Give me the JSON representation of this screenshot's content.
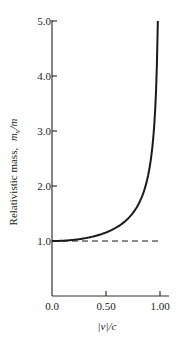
{
  "chart_data": {
    "type": "line",
    "title": "",
    "xlabel": "|v|/c",
    "ylabel_text": "Relativistic  mass,",
    "ylabel_symbol": "m_v/m",
    "xlim": [
      0.0,
      1.0
    ],
    "ylim": [
      0.0,
      5.0
    ],
    "xticks": [
      {
        "value": 0.0,
        "label": "0.0"
      },
      {
        "value": 0.5,
        "label": "0.50"
      },
      {
        "value": 1.0,
        "label": "1.00"
      }
    ],
    "yticks": [
      {
        "value": 1.0,
        "label": "1.0"
      },
      {
        "value": 2.0,
        "label": "2.0"
      },
      {
        "value": 3.0,
        "label": "3.0"
      },
      {
        "value": 4.0,
        "label": "4.0"
      },
      {
        "value": 5.0,
        "label": "5.0"
      }
    ],
    "grid": false,
    "legend": null,
    "series": [
      {
        "name": "relativistic mass ratio",
        "style": "solid",
        "x": [
          0.0,
          0.1,
          0.2,
          0.3,
          0.4,
          0.5,
          0.6,
          0.7,
          0.8,
          0.85,
          0.9,
          0.93,
          0.95,
          0.96,
          0.97,
          0.98
        ],
        "y": [
          1.0,
          1.005,
          1.021,
          1.048,
          1.091,
          1.155,
          1.25,
          1.4,
          1.667,
          1.898,
          2.294,
          2.721,
          3.203,
          3.571,
          4.113,
          5.0
        ]
      },
      {
        "name": "rest mass reference",
        "style": "dashed",
        "x": [
          0.0,
          1.0
        ],
        "y": [
          1.0,
          1.0
        ]
      }
    ]
  },
  "labels": {
    "x_axis": "|v|/c",
    "y_axis_text": "Relativistic  mass,",
    "y_axis_symbol_m": "m",
    "y_axis_symbol_sub": "v",
    "y_axis_symbol_den": "/m"
  },
  "colors": {
    "line": "#1a1a1a",
    "axis": "#333333",
    "background": "#ffffff"
  }
}
